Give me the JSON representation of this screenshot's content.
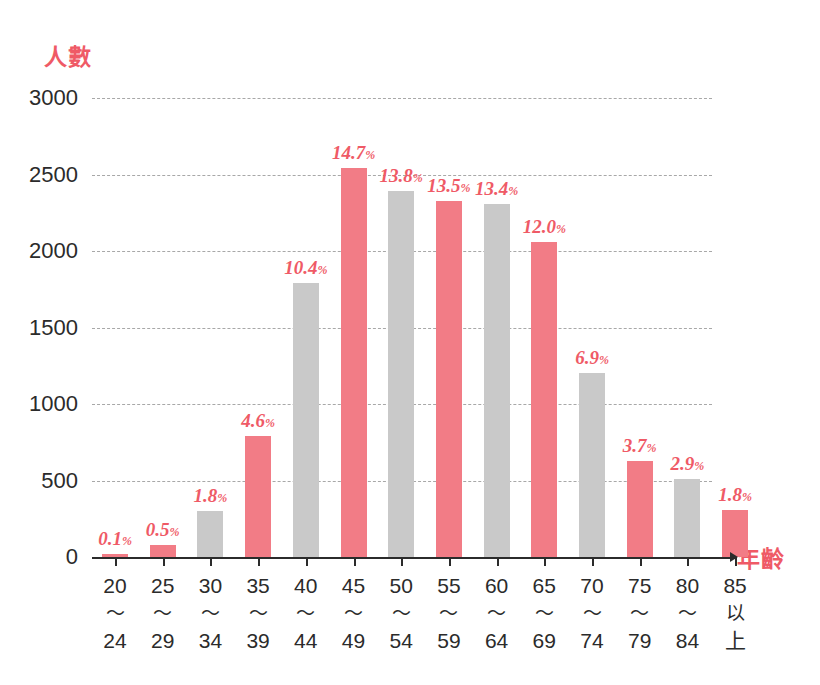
{
  "chart_data": {
    "type": "bar",
    "title": "",
    "subtitle": "",
    "xlabel": "年齡",
    "ylabel": "人數",
    "ylim": [
      0,
      3000
    ],
    "grid": true,
    "legend": false,
    "y_ticks": [
      0,
      500,
      1000,
      1500,
      2000,
      2500,
      3000
    ],
    "y_tick_labels": [
      "0",
      "500",
      "1000",
      "1500",
      "2000",
      "2500",
      "3000"
    ],
    "categories": [
      "20〜24",
      "25〜29",
      "30〜34",
      "35〜39",
      "40〜44",
      "45〜49",
      "50〜54",
      "55〜59",
      "60〜64",
      "65〜69",
      "70〜74",
      "75〜79",
      "80〜84",
      "85以上"
    ],
    "category_parts": [
      {
        "lo": "20",
        "sep": "〜",
        "hi": "24"
      },
      {
        "lo": "25",
        "sep": "〜",
        "hi": "29"
      },
      {
        "lo": "30",
        "sep": "〜",
        "hi": "34"
      },
      {
        "lo": "35",
        "sep": "〜",
        "hi": "39"
      },
      {
        "lo": "40",
        "sep": "〜",
        "hi": "44"
      },
      {
        "lo": "45",
        "sep": "〜",
        "hi": "49"
      },
      {
        "lo": "50",
        "sep": "〜",
        "hi": "54"
      },
      {
        "lo": "55",
        "sep": "〜",
        "hi": "59"
      },
      {
        "lo": "60",
        "sep": "〜",
        "hi": "64"
      },
      {
        "lo": "65",
        "sep": "〜",
        "hi": "69"
      },
      {
        "lo": "70",
        "sep": "〜",
        "hi": "74"
      },
      {
        "lo": "75",
        "sep": "〜",
        "hi": "79"
      },
      {
        "lo": "80",
        "sep": "〜",
        "hi": "84"
      },
      {
        "lo": "85",
        "sep": "以",
        "hi": "上"
      }
    ],
    "values": [
      20,
      80,
      300,
      790,
      1790,
      2540,
      2390,
      2330,
      2310,
      2060,
      1200,
      630,
      510,
      310
    ],
    "data_labels": [
      "0.1",
      "0.5",
      "1.8",
      "4.6",
      "10.4",
      "14.7",
      "13.8",
      "13.5",
      "13.4",
      "12.0",
      "6.9",
      "3.7",
      "2.9",
      "1.8"
    ],
    "data_label_suffix": "%",
    "bar_colors": [
      "pink",
      "pink",
      "gray",
      "pink",
      "gray",
      "pink",
      "gray",
      "pink",
      "gray",
      "pink",
      "gray",
      "pink",
      "gray",
      "pink"
    ],
    "colors": {
      "pink": "#f27c86",
      "gray": "#c9c9c9",
      "accent_text": "#ef5a66",
      "axis": "#2b2b2b",
      "grid": "#9a9a9a",
      "background": "#ffffff"
    }
  }
}
